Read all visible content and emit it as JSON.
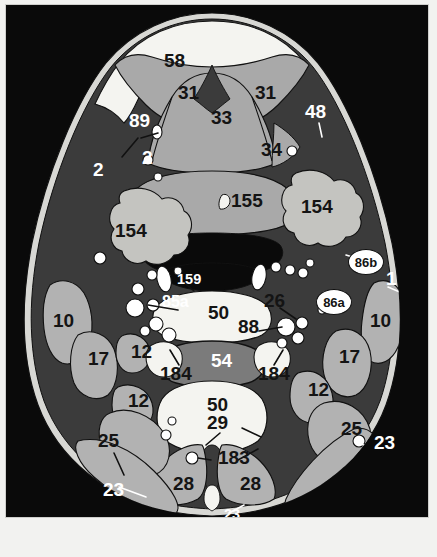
{
  "figure": {
    "type": "anatomical-cross-section",
    "view": "axial",
    "region": "neck",
    "frame_color": "#cfcfcc",
    "background_color": "#0a0a0a"
  },
  "palette": {
    "background": "#0a0a0a",
    "skin_outline": "#d8d8d4",
    "fat_dark": "#3b3b3b",
    "muscle_gray": "#b2b2b2",
    "tissue_mid": "#9d9d9d",
    "fat_white": "#f4f4f0",
    "gland_light": "#c4c4c0",
    "vertebra_body": "#7b7b7b",
    "airway_black": "#0a0a0a",
    "vessel_white": "#ffffff",
    "label_dark": "#141414",
    "label_light": "#ffffff"
  },
  "labels": [
    {
      "id": "l58",
      "text": "58",
      "x": 162,
      "y": 56,
      "size": "s20",
      "tone": "dark",
      "name": "label-58"
    },
    {
      "id": "l31a",
      "text": "31",
      "x": 176,
      "y": 88,
      "size": "s20",
      "tone": "dark",
      "name": "label-31-left"
    },
    {
      "id": "l31b",
      "text": "31",
      "x": 253,
      "y": 88,
      "size": "s20",
      "tone": "dark",
      "name": "label-31-right"
    },
    {
      "id": "l33",
      "text": "33",
      "x": 209,
      "y": 113,
      "size": "s20",
      "tone": "dark",
      "name": "label-33"
    },
    {
      "id": "l34",
      "text": "34",
      "x": 259,
      "y": 145,
      "size": "s20",
      "tone": "dark",
      "name": "label-34"
    },
    {
      "id": "l48",
      "text": "48",
      "x": 303,
      "y": 107,
      "size": "s20",
      "tone": "light",
      "name": "label-48"
    },
    {
      "id": "l89",
      "text": "89",
      "x": 127,
      "y": 116,
      "size": "s20",
      "tone": "light",
      "name": "label-89"
    },
    {
      "id": "l2a",
      "text": "2",
      "x": 91,
      "y": 165,
      "size": "s20",
      "tone": "light",
      "name": "label-2-outer"
    },
    {
      "id": "l2b",
      "text": "2",
      "x": 140,
      "y": 153,
      "size": "s20",
      "tone": "light",
      "name": "label-2-inner"
    },
    {
      "id": "l155",
      "text": "155",
      "x": 229,
      "y": 196,
      "size": "s20",
      "tone": "dark",
      "name": "label-155"
    },
    {
      "id": "l154a",
      "text": "154",
      "x": 113,
      "y": 226,
      "size": "s20",
      "tone": "dark",
      "name": "label-154-left"
    },
    {
      "id": "l154b",
      "text": "154",
      "x": 299,
      "y": 202,
      "size": "s20",
      "tone": "dark",
      "name": "label-154-right"
    },
    {
      "id": "l1",
      "text": "1",
      "x": 384,
      "y": 274,
      "size": "s20",
      "tone": "light",
      "name": "label-1"
    },
    {
      "id": "l159",
      "text": "159",
      "x": 175,
      "y": 277,
      "size": "s15",
      "tone": "light",
      "name": "label-159"
    },
    {
      "id": "l85a",
      "text": "85a",
      "x": 160,
      "y": 299,
      "size": "s17",
      "tone": "light",
      "name": "label-85a"
    },
    {
      "id": "l26",
      "text": "26",
      "x": 262,
      "y": 296,
      "size": "s20",
      "tone": "dark",
      "name": "label-26"
    },
    {
      "id": "l50a",
      "text": "50",
      "x": 206,
      "y": 308,
      "size": "s20",
      "tone": "dark",
      "name": "label-50-upper"
    },
    {
      "id": "l88",
      "text": "88",
      "x": 236,
      "y": 322,
      "size": "s20",
      "tone": "dark",
      "name": "label-88"
    },
    {
      "id": "l10a",
      "text": "10",
      "x": 51,
      "y": 316,
      "size": "s20",
      "tone": "dark",
      "name": "label-10-left"
    },
    {
      "id": "l10b",
      "text": "10",
      "x": 368,
      "y": 316,
      "size": "s20",
      "tone": "dark",
      "name": "label-10-right"
    },
    {
      "id": "l17a",
      "text": "17",
      "x": 86,
      "y": 354,
      "size": "s20",
      "tone": "dark",
      "name": "label-17-left"
    },
    {
      "id": "l17b",
      "text": "17",
      "x": 337,
      "y": 352,
      "size": "s20",
      "tone": "dark",
      "name": "label-17-right"
    },
    {
      "id": "l12a",
      "text": "12",
      "x": 129,
      "y": 347,
      "size": "s20",
      "tone": "dark",
      "name": "label-12-upper-left"
    },
    {
      "id": "l12b",
      "text": "12",
      "x": 126,
      "y": 396,
      "size": "s20",
      "tone": "dark",
      "name": "label-12-lower-left"
    },
    {
      "id": "l12c",
      "text": "12",
      "x": 306,
      "y": 385,
      "size": "s20",
      "tone": "dark",
      "name": "label-12-right"
    },
    {
      "id": "l184a",
      "text": "184",
      "x": 158,
      "y": 369,
      "size": "s20",
      "tone": "dark",
      "name": "label-184-left"
    },
    {
      "id": "l184b",
      "text": "184",
      "x": 256,
      "y": 369,
      "size": "s20",
      "tone": "dark",
      "name": "label-184-right"
    },
    {
      "id": "l54",
      "text": "54",
      "x": 209,
      "y": 356,
      "size": "s20",
      "tone": "light",
      "name": "label-54"
    },
    {
      "id": "l50b",
      "text": "50",
      "x": 205,
      "y": 400,
      "size": "s20",
      "tone": "dark",
      "name": "label-50-lower"
    },
    {
      "id": "l29",
      "text": "29",
      "x": 205,
      "y": 418,
      "size": "s20",
      "tone": "dark",
      "name": "label-29"
    },
    {
      "id": "l183",
      "text": "183",
      "x": 216,
      "y": 453,
      "size": "s20",
      "tone": "dark",
      "name": "label-183"
    },
    {
      "id": "l25a",
      "text": "25",
      "x": 96,
      "y": 436,
      "size": "s20",
      "tone": "dark",
      "name": "label-25-left"
    },
    {
      "id": "l25b",
      "text": "25",
      "x": 339,
      "y": 424,
      "size": "s20",
      "tone": "dark",
      "name": "label-25-right"
    },
    {
      "id": "l23a",
      "text": "23",
      "x": 101,
      "y": 485,
      "size": "s20",
      "tone": "light",
      "name": "label-23-left"
    },
    {
      "id": "l23b",
      "text": "23",
      "x": 372,
      "y": 438,
      "size": "s20",
      "tone": "light",
      "name": "label-23-right"
    },
    {
      "id": "l23c",
      "text": "23",
      "x": 222,
      "y": 512,
      "size": "s15",
      "tone": "light",
      "name": "label-23-midline"
    },
    {
      "id": "l28a",
      "text": "28",
      "x": 171,
      "y": 479,
      "size": "s20",
      "tone": "dark",
      "name": "label-28-left"
    },
    {
      "id": "l28b",
      "text": "28",
      "x": 238,
      "y": 479,
      "size": "s20",
      "tone": "dark",
      "name": "label-28-right"
    }
  ],
  "bubbles": [
    {
      "id": "b86b",
      "text": "86b",
      "x": 342,
      "y": 244,
      "w": 34,
      "h": 24,
      "size": 13,
      "name": "callout-86b"
    },
    {
      "id": "b86a",
      "text": "86a",
      "x": 310,
      "y": 284,
      "w": 34,
      "h": 24,
      "size": 13,
      "name": "callout-86a"
    }
  ],
  "structures": {
    "midline_airway": "oropharynx",
    "vertebra": "cervical vertebral body",
    "note": "numbered key diagram of axial neck section"
  }
}
